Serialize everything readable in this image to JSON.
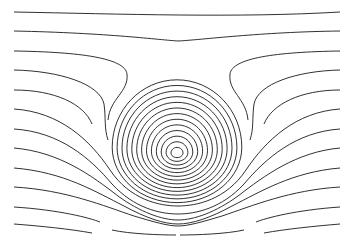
{
  "diagram": {
    "type": "streamline-contours",
    "title": "",
    "stroke_color": "#1a1a1a",
    "background": "#ffffff",
    "vortex_center": [
      177,
      153
    ],
    "closed_contours": {
      "count": 13,
      "center": [
        177,
        153
      ],
      "rx_start": 6,
      "ry_start": 5,
      "rx_step": 4.9,
      "ry_step": 4.6,
      "shift_up_step": 1.6
    },
    "open_streamlines_top": [
      "M14,12 C120,14 240,18 340,12",
      "M14,31 C110,33 160,40 178,41 C200,40 260,32 340,31",
      "M14,51 C80,52 125,58 127,74 C129,92 110,98 108,120",
      "M248,120 C246,98 228,92 230,74 C232,58 276,52 340,51",
      "M14,70 C60,71 100,84 104,104 C106,118 104,128 108,140",
      "M250,140 C254,128 252,118 254,104 C258,84 296,71 340,70",
      "M14,90 C55,90 84,104 92,124",
      "M264,124 C272,104 301,90 340,90"
    ],
    "open_streamlines_bottom": [
      "M14,109 C60,112 90,140 110,170 C130,200 160,206 178,206 C196,206 226,200 246,170 C266,140 296,112 340,109",
      "M14,129 C60,132 90,158 112,184 C134,208 160,214 178,214 C196,214 222,208 244,184 C266,158 296,132 340,129",
      "M14,148 C60,152 92,176 118,196 C140,212 162,220 178,220 C194,220 216,212 238,196 C264,176 296,152 340,148",
      "M14,168 C64,172 96,192 124,206 C146,218 164,224 178,224 C192,224 210,218 232,206 C260,192 292,172 340,168",
      "M14,187 C66,190 104,206 134,216 C154,222 168,226 178,226 C188,226 202,222 222,216 C252,206 290,190 340,187",
      "M14,207 C60,210 90,218 100,222",
      "M256,222 C266,218 296,210 340,207",
      "M112,230 C130,234 160,235 176,235",
      "M180,235 C196,235 226,234 244,230",
      "M14,224 C40,226 70,229 92,233",
      "M264,233 C286,229 316,226 340,224"
    ]
  }
}
